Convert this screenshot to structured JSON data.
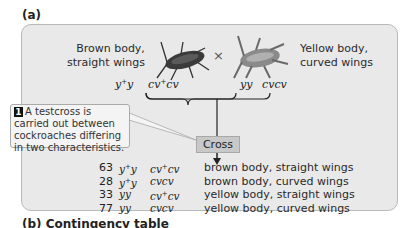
{
  "panel_a": {
    "label": "(a)",
    "parent1": {
      "line1": "Brown body,",
      "line2": "straight wings",
      "genotype_body": "y+y",
      "genotype_wing": "cv+cv"
    },
    "parent2": {
      "line1": "Yellow body,",
      "line2": "curved wings",
      "genotype_body": "yy",
      "genotype_wing": "cvcv"
    },
    "cross_symbol": "×",
    "cross_label": "Cross",
    "callout": {
      "number": "1",
      "text": "A testcross is carried out between cockroaches differing in two characteristics."
    },
    "progeny": [
      {
        "count": "63",
        "body": "y+y",
        "wing": "cv+cv",
        "phenotype": "brown body, straight wings"
      },
      {
        "count": "28",
        "body": "y+y",
        "wing": "cvcv",
        "phenotype": "brown body, curved wings"
      },
      {
        "count": "33",
        "body": "yy",
        "wing": "cv+cv",
        "phenotype": "yellow body, straight wings"
      },
      {
        "count": "77",
        "body": "yy",
        "wing": "cvcv",
        "phenotype": "yellow body, curved wings"
      }
    ]
  },
  "panel_b": {
    "label": "(b)  Contingency table"
  },
  "colors": {
    "panel_bg": "#e9e9e9",
    "cross_box": "#c8c8c8",
    "callout_bg": "#f4f4f4"
  }
}
